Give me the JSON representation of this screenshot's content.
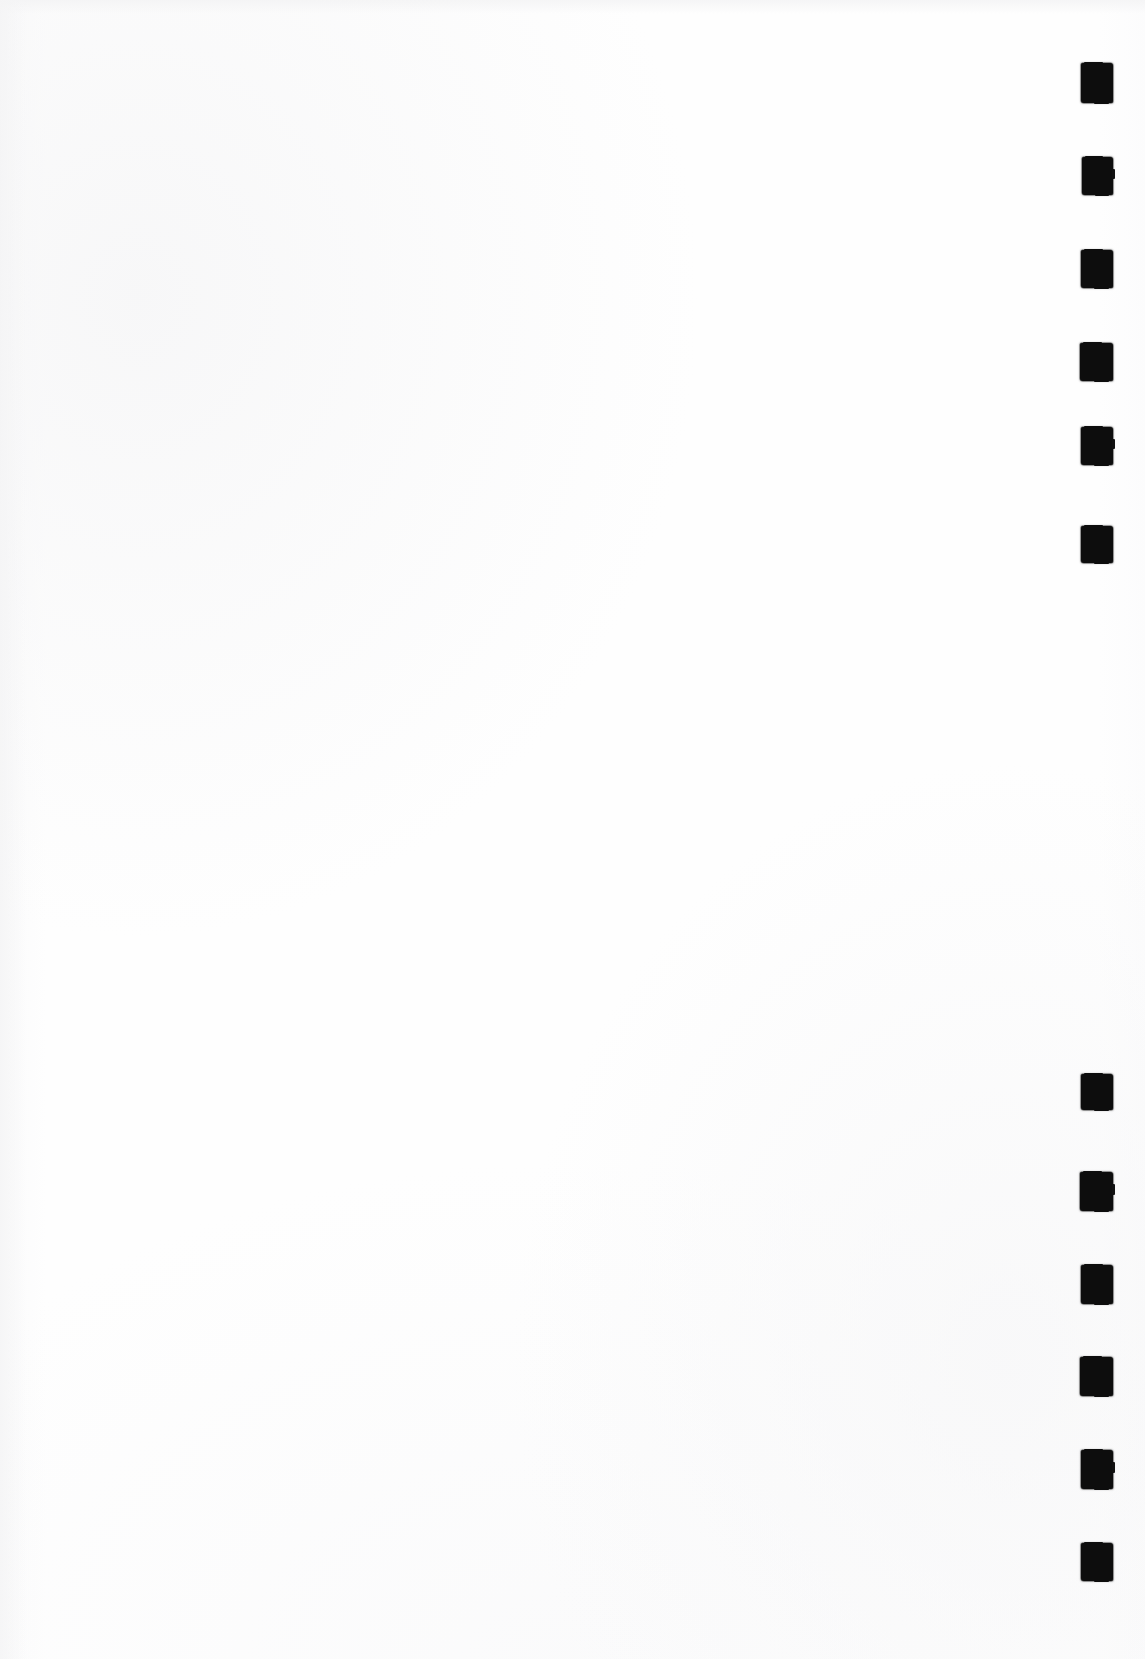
{
  "page": {
    "kind": "scanned-page",
    "width": 1145,
    "height": 1659,
    "paper_color": "#fefefe",
    "ink_color": "#0d0d0d",
    "content_text": ""
  },
  "index_marks": {
    "column_x": 1080,
    "mark_width": 32,
    "groups": [
      {
        "name": "upper-index-group",
        "count": 6,
        "marks": [
          {
            "id": 1,
            "x": 1081,
            "y": 63,
            "w": 32,
            "h": 40
          },
          {
            "id": 2,
            "x": 1082,
            "y": 157,
            "w": 31,
            "h": 38
          },
          {
            "id": 3,
            "x": 1081,
            "y": 250,
            "w": 32,
            "h": 38
          },
          {
            "id": 4,
            "x": 1080,
            "y": 343,
            "w": 33,
            "h": 38
          },
          {
            "id": 5,
            "x": 1081,
            "y": 427,
            "w": 32,
            "h": 38
          },
          {
            "id": 6,
            "x": 1081,
            "y": 526,
            "w": 32,
            "h": 37
          }
        ]
      },
      {
        "name": "lower-index-group",
        "count": 6,
        "marks": [
          {
            "id": 7,
            "x": 1081,
            "y": 1074,
            "w": 32,
            "h": 36
          },
          {
            "id": 8,
            "x": 1080,
            "y": 1172,
            "w": 33,
            "h": 39
          },
          {
            "id": 9,
            "x": 1081,
            "y": 1265,
            "w": 32,
            "h": 39
          },
          {
            "id": 10,
            "x": 1080,
            "y": 1357,
            "w": 33,
            "h": 39
          },
          {
            "id": 11,
            "x": 1081,
            "y": 1450,
            "w": 32,
            "h": 39
          },
          {
            "id": 12,
            "x": 1081,
            "y": 1543,
            "w": 32,
            "h": 38
          }
        ]
      }
    ]
  }
}
